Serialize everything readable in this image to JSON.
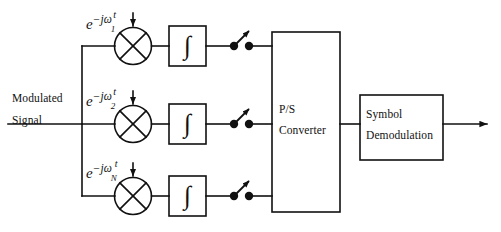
{
  "figure": {
    "type": "block-diagram",
    "width": 501,
    "height": 232,
    "background_color": "#ffffff",
    "line_color": "#111111"
  },
  "input": {
    "label_line1": "Modulated",
    "label_line2": "Signal"
  },
  "branches": [
    {
      "index": 1,
      "carrier": {
        "base": "e",
        "minus": "−",
        "j": "j",
        "omega": "ω",
        "subscript": "1",
        "time": "t"
      },
      "mixer_icon": "multiplier-circle-x-icon",
      "integrator_symbol": "∫",
      "sampler_icon": "sampler-switch-icon"
    },
    {
      "index": 2,
      "carrier": {
        "base": "e",
        "minus": "−",
        "j": "j",
        "omega": "ω",
        "subscript": "2",
        "time": "t"
      },
      "mixer_icon": "multiplier-circle-x-icon",
      "integrator_symbol": "∫",
      "sampler_icon": "sampler-switch-icon"
    },
    {
      "index": 3,
      "carrier": {
        "base": "e",
        "minus": "−",
        "j": "j",
        "omega": "ω",
        "subscript": "N",
        "time": "t"
      },
      "mixer_icon": "multiplier-circle-x-icon",
      "integrator_symbol": "∫",
      "sampler_icon": "sampler-switch-icon"
    }
  ],
  "blocks": {
    "ps_converter": {
      "label_line1": "P/S",
      "label_line2": "Converter"
    },
    "symbol_demodulation": {
      "label_line1": "Symbol",
      "label_line2": "Demodulation"
    }
  },
  "output": {
    "arrow_icon": "output-arrow-icon"
  }
}
